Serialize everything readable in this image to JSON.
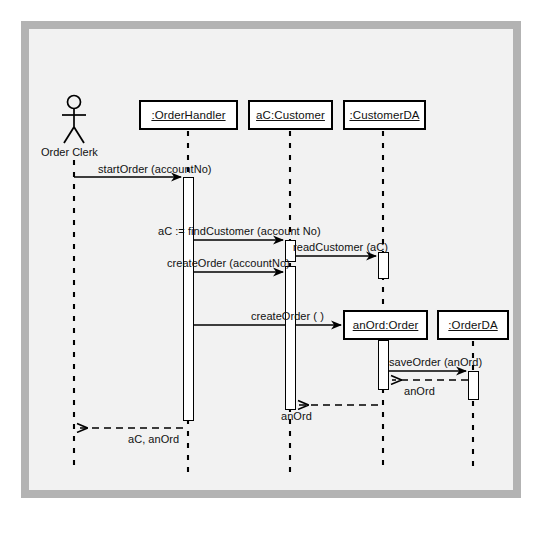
{
  "diagram": {
    "type": "uml-sequence-diagram",
    "background_color": "#f2f2f2",
    "frame_color": "#b3b3b3",
    "line_color": "#000000"
  },
  "actor": {
    "name": "stick-figure-actor",
    "label": "Order Clerk",
    "x": 74
  },
  "lifelines": [
    {
      "id": "orderhandler",
      "label": ":OrderHandler",
      "x": 188,
      "box_x": 139,
      "box_y": 100,
      "box_w": 99,
      "box_h": 30
    },
    {
      "id": "customer",
      "label": "aC:Customer",
      "x": 290,
      "box_x": 248,
      "box_y": 100,
      "box_w": 85,
      "box_h": 30
    },
    {
      "id": "customerda",
      "label": ":CustomerDA",
      "x": 383,
      "box_x": 343,
      "box_y": 100,
      "box_w": 83,
      "box_h": 30
    },
    {
      "id": "order",
      "label": "anOrd:Order",
      "x": 383,
      "box_x": 343,
      "box_y": 310,
      "box_w": 85,
      "box_h": 30
    },
    {
      "id": "orderda",
      "label": ":OrderDA",
      "x": 473,
      "box_x": 437,
      "box_y": 310,
      "box_w": 72,
      "box_h": 30
    }
  ],
  "messages": [
    {
      "id": "m1",
      "label": "startOrder (accountNo)",
      "kind": "call",
      "from": "actor",
      "to": "orderhandler",
      "y": 177
    },
    {
      "id": "m2",
      "label": "aC := findCustomer (account No)",
      "kind": "call",
      "from": "orderhandler",
      "to": "customer",
      "y": 240
    },
    {
      "id": "m3",
      "label": "readCustomer (aC)",
      "kind": "call",
      "from": "customer",
      "to": "customerda",
      "y": 256
    },
    {
      "id": "m4",
      "label": "createOrder (accountNo)",
      "kind": "call",
      "from": "orderhandler",
      "to": "customer",
      "y": 272
    },
    {
      "id": "m5",
      "label": "createOrder ( )",
      "kind": "call",
      "from": "orderhandler",
      "to": "order",
      "y": 325
    },
    {
      "id": "m6",
      "label": "saveOrder (anOrd)",
      "kind": "call",
      "from": "order",
      "to": "orderda",
      "y": 371
    },
    {
      "id": "m7",
      "label": "anOrd",
      "kind": "return",
      "from": "orderda",
      "to": "order",
      "y": 380
    },
    {
      "id": "m8",
      "label": "anOrd",
      "kind": "return",
      "from": "order",
      "to": "customer",
      "y": 405
    },
    {
      "id": "m9",
      "label": "aC, anOrd",
      "kind": "return",
      "from": "orderhandler",
      "to": "actor",
      "y": 428
    }
  ],
  "activations": [
    {
      "id": "a1",
      "lifeline": "orderhandler",
      "x": 183,
      "y": 177,
      "w": 11,
      "h": 244
    },
    {
      "id": "a2",
      "lifeline": "customer",
      "x": 285,
      "y": 240,
      "w": 11,
      "h": 22
    },
    {
      "id": "a3",
      "lifeline": "customer",
      "x": 285,
      "y": 266,
      "w": 11,
      "h": 144
    },
    {
      "id": "a4",
      "lifeline": "customerda",
      "x": 378,
      "y": 252,
      "w": 11,
      "h": 27
    },
    {
      "id": "a5",
      "lifeline": "order",
      "x": 378,
      "y": 340,
      "w": 11,
      "h": 50
    },
    {
      "id": "a6",
      "lifeline": "orderda",
      "x": 468,
      "y": 371,
      "w": 11,
      "h": 29
    }
  ]
}
